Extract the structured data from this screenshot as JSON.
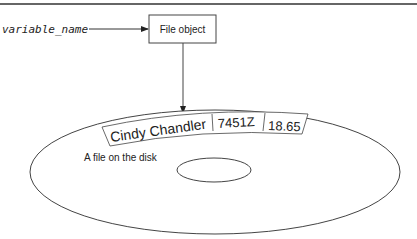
{
  "diagram": {
    "variable_label": "variable_name",
    "file_object_label": "File object",
    "record_fields": [
      "Cindy Chandler",
      "7451Z",
      "18.65"
    ],
    "disk_caption": "A file on the disk",
    "colors": {
      "stroke": "#333333",
      "background": "#ffffff",
      "top_rule": "#555555"
    }
  }
}
